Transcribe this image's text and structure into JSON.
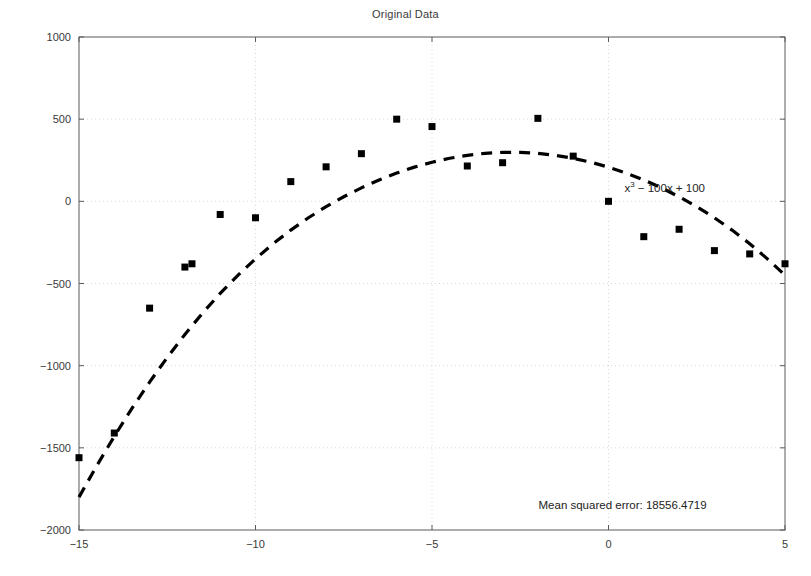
{
  "chart_data": {
    "type": "scatter",
    "title": "Original Data",
    "xlabel": "",
    "ylabel": "",
    "xlim": [
      -15,
      5
    ],
    "ylim": [
      -2000,
      1000
    ],
    "xticks": [
      -15,
      -10,
      -5,
      0,
      5
    ],
    "xticklabels": [
      "-15",
      "-10",
      "-5",
      "0",
      "5"
    ],
    "yticks": [
      -2000,
      -1500,
      -1000,
      -500,
      0,
      500,
      1000
    ],
    "yticklabels": [
      "-2000",
      "-1500",
      "-1000",
      "-500",
      "0",
      "500",
      "1000"
    ],
    "grid": true,
    "legend_position": "none",
    "marker_style": "filled-square",
    "marker_color": "#000000",
    "line_style": "dashed",
    "line_color": "#000000",
    "series": [
      {
        "name": "Original Data",
        "type": "scatter",
        "x": [
          -15,
          -14,
          -13,
          -12,
          -11.8,
          -11,
          -10,
          -9,
          -8,
          -7,
          -6,
          -5,
          -4,
          -3,
          -2,
          -1,
          0,
          1,
          2,
          3,
          4,
          5
        ],
        "y": [
          -1560,
          -1410,
          -650,
          -400,
          -380,
          -80,
          -100,
          120,
          210,
          290,
          500,
          455,
          215,
          235,
          505,
          275,
          0,
          -215,
          -170,
          -300,
          -320,
          -380
        ]
      },
      {
        "name": "Fitted curve",
        "type": "line",
        "equation": "x^3 - 100x + 100",
        "equation_display": "x³ − 100x + 100",
        "x": [
          -15,
          -14.5,
          -14,
          -13.5,
          -13,
          -12.5,
          -12,
          -11.5,
          -11,
          -10.5,
          -10,
          -9.5,
          -9,
          -8.5,
          -8,
          -7.5,
          -7,
          -6.5,
          -6,
          -5.5,
          -5,
          -4.5,
          -4,
          -3.5,
          -3,
          -2.5,
          -2,
          -1.5,
          -1,
          -0.5,
          0,
          0.5,
          1,
          1.5,
          2,
          2.5,
          3,
          3.5,
          4,
          4.5,
          5
        ],
        "y": [
          -1800,
          -1610,
          -1430,
          -1260,
          -1100,
          -950,
          -810,
          -680,
          -560,
          -450,
          -350,
          -258,
          -175,
          -100,
          -32,
          28,
          82,
          130,
          172,
          208,
          238,
          262,
          280,
          292,
          298,
          298,
          292,
          280,
          262,
          238,
          208,
          172,
          130,
          82,
          28,
          -32,
          -100,
          -175,
          -258,
          -350,
          -450
        ]
      }
    ],
    "annotations": [
      {
        "id": "equation-label",
        "text": "x³ − 100x + 100",
        "base": "x",
        "exponent": "3",
        "rest": " − 100x + 100",
        "x": 0.45,
        "y": 60
      },
      {
        "id": "mse-label",
        "text": "Mean squared error: 18556.4719",
        "x": 0.4,
        "y": -1870
      }
    ]
  },
  "figure": {
    "title": "Original Data",
    "background_color": "#ffffff",
    "axes_color": "#5a5a5a",
    "grid_color": "#d8d8d8",
    "text_color": "#3a3a3a"
  }
}
